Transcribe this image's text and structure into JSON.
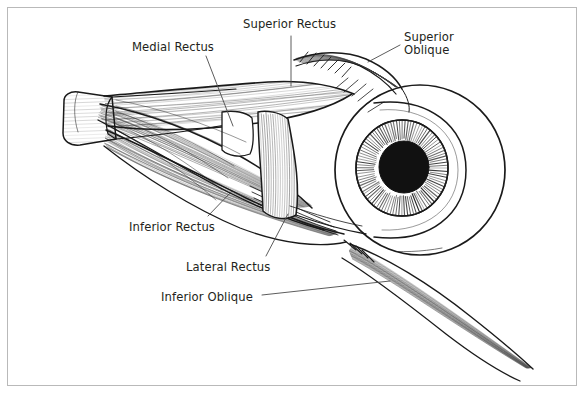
{
  "figure": {
    "name": "extraocular-muscles-of-the-eye",
    "background_color": "#ffffff",
    "ink_color": "#1a1a1a",
    "label_color": "#231f20",
    "border_color": "#b9b9b9",
    "width": 586,
    "height": 395
  },
  "labels": [
    {
      "id": "superior-rectus",
      "text": "Superior Rectus",
      "x": 243,
      "y": 18
    },
    {
      "id": "superior-oblique",
      "text": "Superior\nOblique",
      "x": 404,
      "y": 31
    },
    {
      "id": "medial-rectus",
      "text": "Medial Rectus",
      "x": 132,
      "y": 41
    },
    {
      "id": "inferior-rectus",
      "text": "Inferior Rectus",
      "x": 129,
      "y": 221
    },
    {
      "id": "lateral-rectus",
      "text": "Lateral Rectus",
      "x": 186,
      "y": 261
    },
    {
      "id": "inferior-oblique",
      "text": "Inferior Oblique",
      "x": 161,
      "y": 291
    }
  ],
  "leader_lines": [
    {
      "id": "leader-superior-rectus",
      "from": [
        291,
        36
      ],
      "to": [
        291,
        86
      ]
    },
    {
      "id": "leader-superior-oblique",
      "from": [
        400,
        45
      ],
      "to": [
        368,
        62
      ]
    },
    {
      "id": "leader-medial-rectus",
      "from": [
        206,
        56
      ],
      "to": [
        233,
        126
      ]
    },
    {
      "id": "leader-inferior-rectus",
      "from": [
        208,
        216
      ],
      "to": [
        232,
        191
      ]
    },
    {
      "id": "leader-lateral-rectus",
      "from": [
        266,
        256
      ],
      "to": [
        288,
        214
      ]
    },
    {
      "id": "leader-inferior-oblique",
      "from": [
        262,
        295
      ],
      "to": [
        390,
        281
      ]
    }
  ],
  "structures": [
    {
      "id": "eyeball-globe",
      "label": "Eyeball (globe)",
      "center": [
        420,
        170
      ],
      "radius": 85
    },
    {
      "id": "cornea-bulge",
      "label": "Cornea",
      "center": [
        424,
        170
      ]
    },
    {
      "id": "iris",
      "label": "Iris",
      "center": [
        402,
        168
      ],
      "radius_outer": 46,
      "striations": 96
    },
    {
      "id": "pupil",
      "label": "Pupil",
      "center": [
        404,
        167
      ],
      "radius": 25,
      "fill": "#111111"
    },
    {
      "id": "optic-nerve-stub",
      "label": "Optic nerve (cut)",
      "x": 62,
      "y": 96
    },
    {
      "id": "superior-rectus-belly",
      "label": "Superior rectus muscle belly"
    },
    {
      "id": "superior-oblique-tendon",
      "label": "Superior oblique tendon"
    },
    {
      "id": "medial-rectus-belly",
      "label": "Medial rectus muscle belly"
    },
    {
      "id": "lateral-rectus-band",
      "label": "Lateral rectus band"
    },
    {
      "id": "inferior-rectus-belly",
      "label": "Inferior rectus muscle belly"
    },
    {
      "id": "inferior-oblique-band",
      "label": "Inferior oblique muscle band"
    }
  ]
}
